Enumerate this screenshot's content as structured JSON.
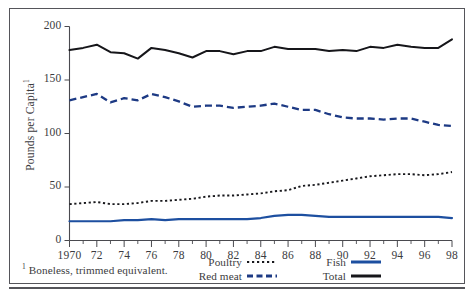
{
  "figure": {
    "ylabel": "Pounds per Capita",
    "ylabel_superscript": "1",
    "footnote_marker": "1",
    "footnote": "Boneless, trimmed equivalent."
  },
  "legend": {
    "items": [
      {
        "label": "Poultry",
        "style": "dotted",
        "color": "#18181c",
        "icon": "dotted-line-swatch"
      },
      {
        "label": "Fish",
        "style": "solid",
        "color": "#1d4fa0",
        "icon": "solid-blue-line-swatch"
      },
      {
        "label": "Red meat",
        "style": "dashed",
        "color": "#1d3a84",
        "icon": "dashed-blue-line-swatch"
      },
      {
        "label": "Total",
        "style": "solid",
        "color": "#16161a",
        "icon": "solid-black-line-swatch"
      }
    ]
  },
  "chart_data": {
    "type": "line",
    "title": "",
    "xlabel": "",
    "ylabel": "Pounds per Capita",
    "xlim": [
      1970,
      1998
    ],
    "ylim": [
      0,
      200
    ],
    "yticks": [
      0,
      50,
      100,
      150,
      200
    ],
    "ytick_labels": [
      "0",
      "50",
      "100",
      "150",
      "200"
    ],
    "x": [
      1970,
      1971,
      1972,
      1973,
      1974,
      1975,
      1976,
      1977,
      1978,
      1979,
      1980,
      1981,
      1982,
      1983,
      1984,
      1985,
      1986,
      1987,
      1988,
      1989,
      1990,
      1991,
      1992,
      1993,
      1994,
      1995,
      1996,
      1997,
      1998
    ],
    "xtick_labels": [
      "1970",
      "72",
      "74",
      "76",
      "78",
      "80",
      "82",
      "84",
      "86",
      "88",
      "90",
      "92",
      "94",
      "96",
      "98"
    ],
    "xtick_years": [
      1970,
      1972,
      1974,
      1976,
      1978,
      1980,
      1982,
      1984,
      1986,
      1988,
      1990,
      1992,
      1994,
      1996,
      1998
    ],
    "grid": false,
    "legend_position": "below-right",
    "series": [
      {
        "name": "Total",
        "color": "#16161a",
        "style": "solid",
        "values": [
          178,
          180,
          183,
          176,
          175,
          170,
          180,
          178,
          175,
          171,
          177,
          177,
          174,
          177,
          177,
          181,
          179,
          179,
          179,
          177,
          178,
          177,
          181,
          180,
          183,
          181,
          180,
          180,
          188
        ]
      },
      {
        "name": "Red meat",
        "color": "#1d3a84",
        "style": "dashed",
        "values": [
          131,
          134,
          137,
          129,
          133,
          131,
          137,
          134,
          130,
          125,
          126,
          126,
          124,
          125,
          126,
          128,
          125,
          122,
          122,
          118,
          115,
          114,
          114,
          113,
          114,
          114,
          111,
          108,
          107
        ]
      },
      {
        "name": "Poultry",
        "color": "#18181c",
        "style": "dotted",
        "values": [
          34,
          35,
          36,
          34,
          34,
          35,
          37,
          37,
          38,
          39,
          41,
          42,
          42,
          43,
          44,
          46,
          47,
          51,
          52,
          54,
          56,
          58,
          60,
          61,
          62,
          62,
          61,
          62,
          64
        ]
      },
      {
        "name": "Fish",
        "color": "#1d4fa0",
        "style": "solid",
        "values": [
          18,
          18,
          18,
          18,
          19,
          19,
          20,
          19,
          20,
          20,
          20,
          20,
          20,
          20,
          21,
          23,
          24,
          24,
          23,
          22,
          22,
          22,
          22,
          22,
          22,
          22,
          22,
          22,
          21
        ]
      }
    ]
  }
}
